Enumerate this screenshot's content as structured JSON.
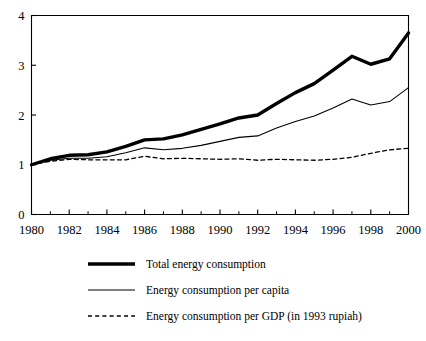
{
  "chart_data": {
    "type": "line",
    "title": "",
    "subtitle": "",
    "xlabel": "",
    "ylabel": "",
    "xlim": [
      1980,
      2000
    ],
    "ylim": [
      0,
      4
    ],
    "grid": false,
    "legend_position": "below",
    "x_tick_labels": [
      "1980",
      "1982",
      "1984",
      "1986",
      "1988",
      "1990",
      "1992",
      "1994",
      "1996",
      "1998",
      "2000"
    ],
    "x_tick_values": [
      1980,
      1982,
      1984,
      1986,
      1988,
      1990,
      1992,
      1994,
      1996,
      1998,
      2000
    ],
    "x_minor_tick_values": [
      1981,
      1983,
      1985,
      1987,
      1989,
      1991,
      1993,
      1995,
      1997,
      1999
    ],
    "y_tick_labels": [
      "0",
      "1",
      "2",
      "3",
      "4"
    ],
    "y_tick_values": [
      0,
      1,
      2,
      3,
      4
    ],
    "x": [
      1980,
      1981,
      1982,
      1983,
      1984,
      1985,
      1986,
      1987,
      1988,
      1989,
      1990,
      1991,
      1992,
      1993,
      1994,
      1995,
      1996,
      1997,
      1998,
      1999,
      2000
    ],
    "series": [
      {
        "name": "Total energy consumption",
        "style": "thick-solid",
        "stroke_width": 3.4,
        "dash": "none",
        "values": [
          1.0,
          1.12,
          1.19,
          1.2,
          1.26,
          1.37,
          1.5,
          1.52,
          1.6,
          1.71,
          1.82,
          1.94,
          2.0,
          2.23,
          2.45,
          2.63,
          2.9,
          3.18,
          3.02,
          3.13,
          3.65
        ]
      },
      {
        "name": "Energy consumption per capita",
        "style": "thin-solid",
        "stroke_width": 1.1,
        "dash": "none",
        "values": [
          1.0,
          1.09,
          1.13,
          1.13,
          1.16,
          1.24,
          1.34,
          1.3,
          1.33,
          1.39,
          1.47,
          1.55,
          1.58,
          1.74,
          1.87,
          1.98,
          2.14,
          2.32,
          2.2,
          2.27,
          2.55
        ]
      },
      {
        "name": "Energy consumption per GDP (in 1993 rupiah)",
        "style": "dashed",
        "stroke_width": 1.3,
        "dash": "4,3.2",
        "values": [
          1.0,
          1.07,
          1.11,
          1.1,
          1.1,
          1.1,
          1.17,
          1.12,
          1.13,
          1.12,
          1.11,
          1.12,
          1.09,
          1.11,
          1.1,
          1.09,
          1.11,
          1.15,
          1.23,
          1.3,
          1.33
        ]
      }
    ]
  },
  "legend": {
    "items": [
      {
        "label": "Total energy consumption",
        "swatch": "thick-solid-line-swatch"
      },
      {
        "label": "Energy consumption per capita",
        "swatch": "thin-solid-line-swatch"
      },
      {
        "label": "Energy consumption per GDP (in 1993 rupiah)",
        "swatch": "dashed-line-swatch"
      }
    ]
  },
  "colors": {
    "line": "#000000",
    "axis": "#000000",
    "background": "#ffffff"
  }
}
